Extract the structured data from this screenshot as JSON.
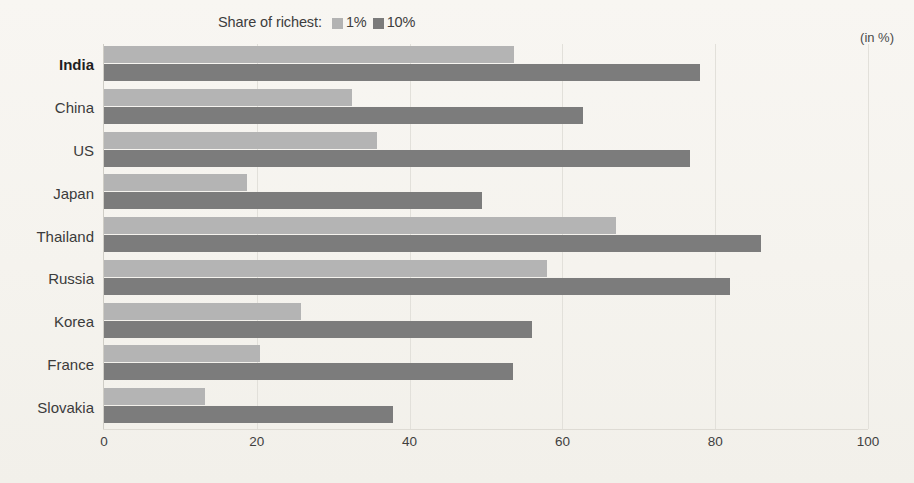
{
  "legend": {
    "title": "Share of richest:",
    "entries": [
      {
        "label": "1%",
        "color": "#b4b4b4",
        "swatch_name": "legend-swatch-1pct"
      },
      {
        "label": "10%",
        "color": "#7c7c7c",
        "swatch_name": "legend-swatch-10pct"
      }
    ]
  },
  "unit_note": "(in %)",
  "chart_data": {
    "type": "bar",
    "orientation": "horizontal",
    "title": "",
    "subtitle": "",
    "xlabel": "",
    "ylabel": "",
    "xlim": [
      0,
      100
    ],
    "ylim": null,
    "grid": true,
    "legend_position": "top-center",
    "annotations": [
      "(in %)"
    ],
    "categories": [
      "India",
      "China",
      "US",
      "Japan",
      "Thailand",
      "Russia",
      "Korea",
      "France",
      "Slovakia"
    ],
    "highlighted_category": "India",
    "xticks": [
      0,
      20,
      40,
      60,
      80,
      100
    ],
    "xticklabels": [
      "0",
      "20",
      "40",
      "60",
      "80",
      "100"
    ],
    "series": [
      {
        "name": "1%",
        "color": "#b4b4b4",
        "values": [
          53.7,
          32.5,
          35.7,
          18.7,
          67.0,
          58.0,
          25.8,
          20.4,
          13.2
        ]
      },
      {
        "name": "10%",
        "color": "#7c7c7c",
        "values": [
          78.0,
          62.7,
          76.7,
          49.5,
          86.0,
          82.0,
          56.0,
          53.5,
          37.8
        ]
      }
    ]
  }
}
